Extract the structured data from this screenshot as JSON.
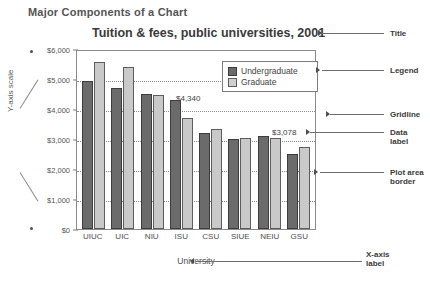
{
  "heading": "Major Components of a Chart",
  "chart_data": {
    "type": "bar",
    "title": "Tuition & fees, public universities, 2001",
    "xlabel": "University",
    "ylabel": "",
    "ylim": [
      0,
      6000
    ],
    "grid": true,
    "legend_position": "top-right",
    "categories": [
      "UIUC",
      "UIC",
      "NIU",
      "ISU",
      "CSU",
      "SIUE",
      "NEIU",
      "GSU"
    ],
    "y_ticks": [
      "$0",
      "$1,000",
      "$2,000",
      "$3,000",
      "$4,000",
      "$5,000",
      "$6,000"
    ],
    "y_tick_values": [
      0,
      1000,
      2000,
      3000,
      4000,
      5000,
      6000
    ],
    "series": [
      {
        "name": "Undergraduate",
        "color": "#6b6b6b",
        "values": [
          5004,
          4742,
          4552,
          4340,
          3228,
          3036,
          3120,
          2520
        ]
      },
      {
        "name": "Graduate",
        "color": "#c9c9c9",
        "values": [
          5640,
          5470,
          4522,
          3744,
          3372,
          3060,
          3078,
          2760
        ]
      }
    ],
    "data_labels": [
      {
        "text": "$4,340",
        "series": "Undergraduate",
        "category": "ISU",
        "value": 4340
      },
      {
        "text": "$3,078",
        "series": "Graduate",
        "category": "NEIU",
        "value": 3078
      }
    ]
  },
  "annotations": {
    "y_axis_scale": "Y-axis scale",
    "x_axis_label": "X-axis\nlabel",
    "callouts": [
      {
        "key": "title",
        "label": "Title"
      },
      {
        "key": "legend",
        "label": "Legend"
      },
      {
        "key": "gridline",
        "label": "Gridline"
      },
      {
        "key": "data_label",
        "label": "Data\nlabel"
      },
      {
        "key": "plot_area_border",
        "label": "Plot area\nborder"
      }
    ]
  }
}
